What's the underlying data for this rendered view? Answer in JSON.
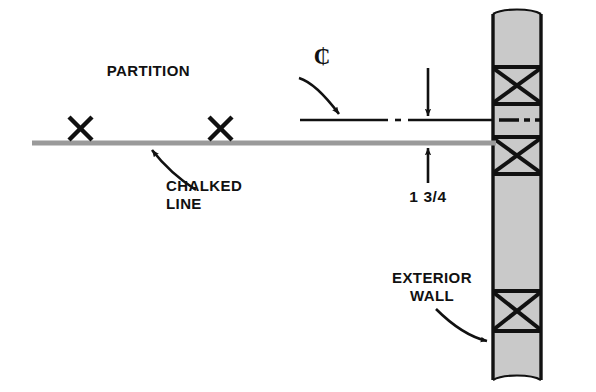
{
  "drawing": {
    "title": "Partition layout at exterior wall",
    "background_color": "#ffffff",
    "ink_color": "#111111",
    "chalk_line_color": "#9a9a9a",
    "wall_fill_color": "#c9c9c9",
    "width": 596,
    "height": 392
  },
  "labels": {
    "partition": "PARTITION",
    "centerline_symbol": "₵",
    "chalked_line_1": "CHALKED",
    "chalked_line_2": "LINE",
    "dimension": "1  3/4",
    "exterior_wall_1": "EXTERIOR",
    "exterior_wall_2": "WALL"
  },
  "elements": {
    "chalked_line": {
      "name": "chalked-line",
      "x_start": 32,
      "x_end": 496,
      "y": 143,
      "thickness": 5
    },
    "partition_centerline": {
      "name": "partition-centerline",
      "y": 120,
      "segments": [
        {
          "x_start": 300,
          "x_end": 388
        },
        {
          "x_start": 395,
          "x_end": 401
        },
        {
          "x_start": 408,
          "x_end": 492
        }
      ],
      "thickness": 2.5
    },
    "layout_marks": [
      {
        "name": "layout-x-mark-1",
        "cx": 80,
        "cy": 128,
        "size": 12
      },
      {
        "name": "layout-x-mark-2",
        "cx": 220,
        "cy": 128,
        "size": 12
      }
    ],
    "dimension_arrows": {
      "down_arrow": {
        "x": 428,
        "y_start": 68,
        "y_end": 118
      },
      "up_arrow": {
        "x": 428,
        "y_start": 183,
        "y_end": 146
      }
    },
    "exterior_wall": {
      "name": "exterior-wall",
      "left": 493,
      "right": 541,
      "top": 14,
      "bottom": 380,
      "fill": "#c9c9c9",
      "brace_cells": [
        {
          "top": 66,
          "bottom": 105
        },
        {
          "top": 136,
          "bottom": 175
        },
        {
          "top": 290,
          "bottom": 332
        }
      ],
      "centerline_band": {
        "top": 105,
        "bottom": 136
      },
      "centerline_dashes": [
        {
          "x_start": 500,
          "x_end": 518
        },
        {
          "x_start": 523,
          "x_end": 529
        },
        {
          "x_start": 534,
          "x_end": 540
        }
      ]
    },
    "leaders": {
      "partition_leader": "curved arrow from PARTITION label down-right to partition centerline",
      "chalked_leader": "curved arrow from CHALKED LINE label up-left to chalked line",
      "exterior_wall_leader": "curved arrow from EXTERIOR WALL label down-right to wall face"
    }
  },
  "label_positions": {
    "partition": {
      "x": 190,
      "y": 76
    },
    "centerline_symbol": {
      "x": 322,
      "y": 64
    },
    "chalked_line_1": {
      "x": 166,
      "y": 191
    },
    "chalked_line_2": {
      "x": 166,
      "y": 209
    },
    "dimension": {
      "x": 428,
      "y": 202
    },
    "exterior_wall_1": {
      "x": 432,
      "y": 283
    },
    "exterior_wall_2": {
      "x": 432,
      "y": 301
    }
  }
}
